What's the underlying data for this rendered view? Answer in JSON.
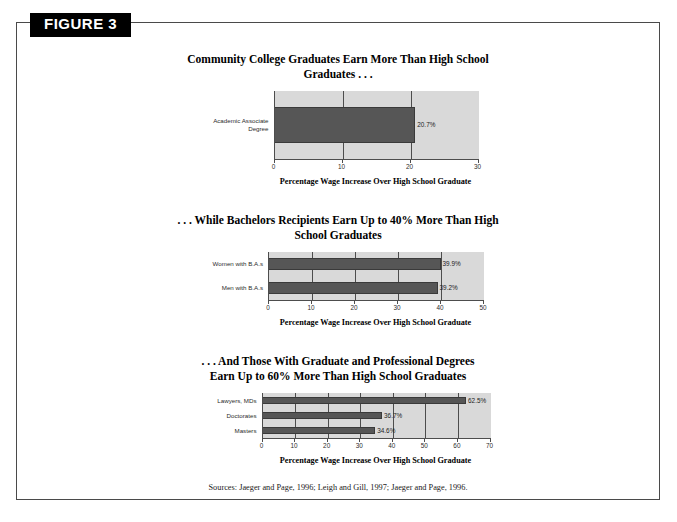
{
  "figure": {
    "tab_label": "FIGURE 3",
    "sources": "Sources:  Jaeger and Page, 1996; Leigh and Gill, 1997; Jaeger and Page, 1996."
  },
  "chart_data": [
    {
      "type": "bar",
      "orientation": "horizontal",
      "title": "Community College Graduates Earn More Than High School Graduates . . .",
      "xlabel": "Percentage Wage Increase Over High School Graduate",
      "ylabel": "",
      "categories": [
        "Academic Associate\nDegree"
      ],
      "values": [
        20.7
      ],
      "value_labels": [
        "20.7%"
      ],
      "xlim": [
        0,
        30
      ],
      "xticks": [
        0,
        10,
        20,
        30
      ],
      "xtick_labels": [
        "0",
        "10",
        "20",
        "30"
      ],
      "grid": true,
      "legend": "none",
      "bar_color": "#565656",
      "plot_bg": "#d9d9d9"
    },
    {
      "type": "bar",
      "orientation": "horizontal",
      "title": ". . . While Bachelors Recipients Earn Up to 40% More Than High School Graduates",
      "xlabel": "Percentage Wage Increase Over High School Graduate",
      "ylabel": "",
      "categories": [
        "Women with B.A.s",
        "Men with B.A.s"
      ],
      "values": [
        39.9,
        39.2
      ],
      "value_labels": [
        "39.9%",
        "39.2%"
      ],
      "xlim": [
        0,
        50
      ],
      "xticks": [
        0,
        10,
        20,
        30,
        40,
        50
      ],
      "xtick_labels": [
        "0",
        "10",
        "20",
        "30",
        "40",
        "50"
      ],
      "grid": true,
      "legend": "none",
      "bar_color": "#565656",
      "plot_bg": "#d9d9d9"
    },
    {
      "type": "bar",
      "orientation": "horizontal",
      "title": ". . . And Those With Graduate and Professional Degrees Earn Up to 60% More Than High School Graduates",
      "xlabel": "Percentage Wage Increase Over High School Graduate",
      "ylabel": "",
      "categories": [
        "Lawyers, MDs",
        "Doctorates",
        "Masters"
      ],
      "values": [
        62.5,
        36.7,
        34.6
      ],
      "value_labels": [
        "62.5%",
        "36.7%",
        "34.6%"
      ],
      "xlim": [
        0,
        70
      ],
      "xticks": [
        0,
        10,
        20,
        30,
        40,
        50,
        60,
        70
      ],
      "xtick_labels": [
        "0",
        "10",
        "20",
        "30",
        "40",
        "50",
        "60",
        "70"
      ],
      "grid": true,
      "legend": "none",
      "bar_color": "#565656",
      "plot_bg": "#d9d9d9"
    }
  ]
}
